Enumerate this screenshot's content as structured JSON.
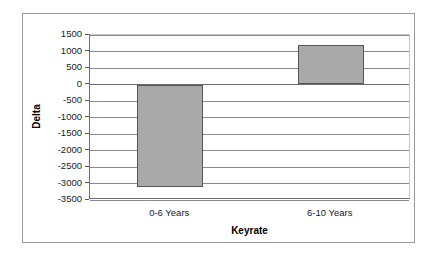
{
  "chart_data": {
    "type": "bar",
    "title": "",
    "subtitle": "",
    "xlabel": "Keyrate",
    "ylabel": "Delta",
    "categories": [
      "0-6 Years",
      "6-10 Years"
    ],
    "values": [
      -3100,
      1200
    ],
    "series": [
      {
        "name": "Delta",
        "values": [
          -3100,
          1200
        ]
      }
    ],
    "ylim": [
      -3500,
      1500
    ],
    "ytick_step": 500,
    "yticks": [
      1500,
      1000,
      500,
      0,
      -500,
      -1000,
      -1500,
      -2000,
      -2500,
      -3000,
      -3500
    ],
    "ytick_labels": [
      "1500",
      "1000",
      "500",
      "0",
      "-500",
      "-1000",
      "-1500",
      "-2000",
      "-2500",
      "-3000",
      "-3500"
    ],
    "grid": true,
    "grid_axis": "y",
    "legend": false,
    "legend_position": "none",
    "bar_fill_color": "#a9a9a9",
    "bar_edge_color": "#555555",
    "plot_background_color": "#ffffff",
    "gridline_color": "#8a8a8a",
    "panel_border_color": "#9a9a9a",
    "annotations": []
  }
}
